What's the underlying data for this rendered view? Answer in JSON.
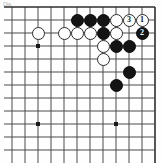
{
  "figure": {
    "caption_mark": "Dia.",
    "type": "go-board-diagram",
    "board": {
      "columns": 12,
      "rows": 12,
      "cell_px": 13,
      "origin_x": 12,
      "origin_y": 7,
      "edges": {
        "top": true,
        "right": true,
        "bottom": false,
        "left": false
      },
      "line_color": "#4a4a4a",
      "edge_color": "#2e2e2e",
      "background": "#fefefe"
    },
    "star_points": [
      {
        "col": 2,
        "row": 3
      },
      {
        "col": 2,
        "row": 9
      },
      {
        "col": 8,
        "row": 9
      }
    ],
    "stones": [
      {
        "color": "white",
        "col": 2,
        "row": 2,
        "label": ""
      },
      {
        "color": "black",
        "col": 5,
        "row": 1,
        "label": ""
      },
      {
        "color": "black",
        "col": 6,
        "row": 1,
        "label": ""
      },
      {
        "color": "black",
        "col": 7,
        "row": 1,
        "label": ""
      },
      {
        "color": "white",
        "col": 8,
        "row": 1,
        "label": ""
      },
      {
        "color": "white",
        "col": 9,
        "row": 1,
        "label": "3"
      },
      {
        "color": "white",
        "col": 10,
        "row": 1,
        "label": "1"
      },
      {
        "color": "white",
        "col": 4,
        "row": 2,
        "label": ""
      },
      {
        "color": "white",
        "col": 5,
        "row": 2,
        "label": ""
      },
      {
        "color": "white",
        "col": 6,
        "row": 2,
        "label": ""
      },
      {
        "color": "black",
        "col": 7,
        "row": 2,
        "label": ""
      },
      {
        "color": "white",
        "col": 8,
        "row": 2,
        "label": ""
      },
      {
        "color": "black",
        "col": 10,
        "row": 2,
        "label": "2"
      },
      {
        "color": "white",
        "col": 7,
        "row": 3,
        "label": ""
      },
      {
        "color": "black",
        "col": 8,
        "row": 3,
        "label": ""
      },
      {
        "color": "black",
        "col": 9,
        "row": 3,
        "label": ""
      },
      {
        "color": "white",
        "col": 7,
        "row": 4,
        "label": ""
      },
      {
        "color": "black",
        "col": 9,
        "row": 5,
        "label": ""
      },
      {
        "color": "black",
        "col": 8,
        "row": 6,
        "label": ""
      }
    ],
    "move_sequence": [
      {
        "number": "1",
        "color": "white",
        "col": 10,
        "row": 1
      },
      {
        "number": "2",
        "color": "black",
        "col": 10,
        "row": 2
      },
      {
        "number": "3",
        "color": "white",
        "col": 9,
        "row": 1
      }
    ],
    "colors": {
      "black_stone": "#141414",
      "white_stone": "#ffffff",
      "white_stone_border": "#2b2b2b",
      "grid": "#4a4a4a",
      "star_point": "#1a1a1a"
    }
  }
}
